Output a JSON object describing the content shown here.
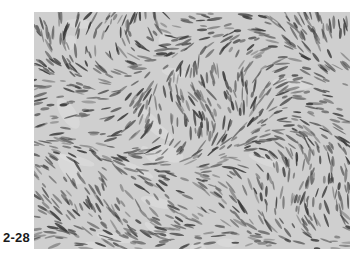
{
  "figure": {
    "label": "2-28",
    "image_description": "grayscale histology micrograph showing densely packed spindle-shaped cells in a storiform/fascicular pattern",
    "colors": {
      "background": "#cfcfcf",
      "stroma_light": "#e2e2e2",
      "nuclei_dark": "#3a3a3a",
      "nuclei_mid": "#6a6a6a"
    }
  }
}
